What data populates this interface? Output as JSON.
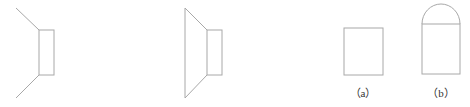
{
  "figures": [
    {
      "id": "figure-left",
      "description": "horn-shaped outline with open diagonal lines attached to a rectangle"
    },
    {
      "id": "figure-middle",
      "description": "closed trapezoidal horn shape attached to a rectangle"
    },
    {
      "id": "figure-a",
      "label": "（a）",
      "description": "rectangle"
    },
    {
      "id": "figure-b",
      "label": "（b）",
      "description": "rectangle topped with a semicircle"
    }
  ],
  "colors": {
    "stroke": "#a8a8a8",
    "label": "#333333",
    "background": "#ffffff"
  }
}
